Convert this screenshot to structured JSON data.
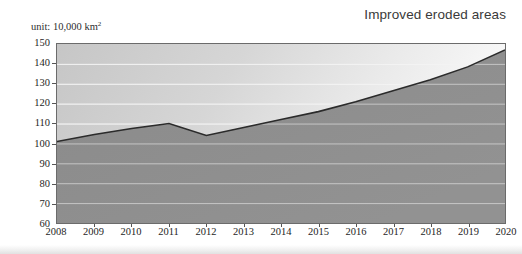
{
  "chart_data": {
    "type": "area",
    "title": "Improved eroded areas",
    "unit_label": "unit: 10,000 km",
    "unit_exponent": "2",
    "xlabel": "",
    "ylabel": "",
    "categories": [
      "2008",
      "2009",
      "2010",
      "2011",
      "2012",
      "2013",
      "2014",
      "2015",
      "2016",
      "2017",
      "2018",
      "2019",
      "2020"
    ],
    "values": [
      101,
      104.5,
      107.5,
      110,
      104,
      108,
      112,
      116,
      121,
      126.5,
      132,
      138.5,
      147
    ],
    "ylim": [
      60,
      150
    ],
    "yticks": [
      150,
      140,
      130,
      120,
      110,
      100,
      90,
      80,
      70,
      60
    ],
    "grid": true,
    "legend": "none",
    "series": [
      {
        "name": "Improved eroded areas",
        "values": [
          101,
          104.5,
          107.5,
          110,
          104,
          108,
          112,
          116,
          121,
          126.5,
          132,
          138.5,
          147
        ]
      }
    ],
    "colors": {
      "area_fill": "#8d8d8d",
      "line": "#2b2b2b",
      "plot_background": "#d8d8d8",
      "gridline": "#f4f4f4",
      "frame": "#6b6b6b",
      "title_text": "#3a3a3a",
      "axis_text": "#1e1e1e"
    }
  }
}
